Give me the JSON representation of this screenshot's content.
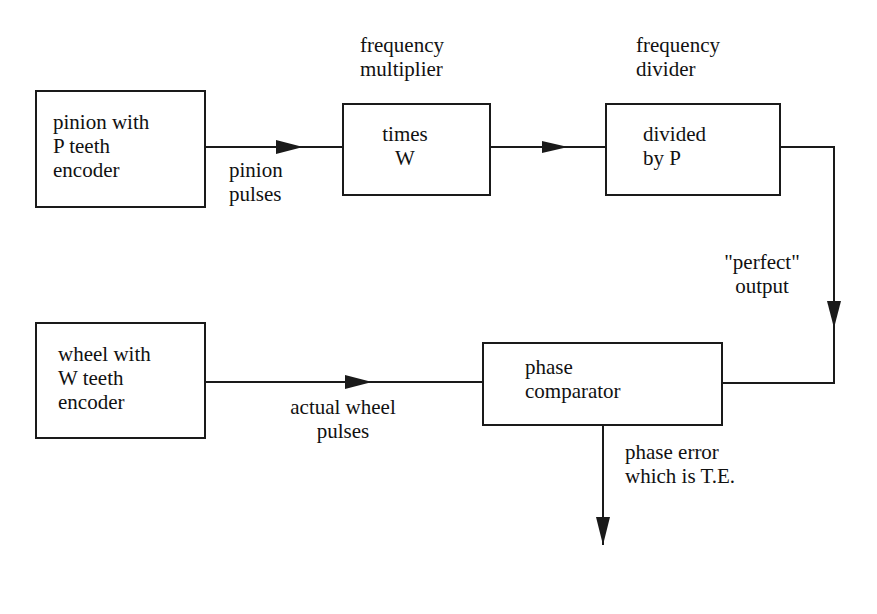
{
  "diagram": {
    "type": "block-diagram",
    "blocks": {
      "pinion_encoder": {
        "text": "pinion with\nP teeth\nencoder"
      },
      "multiplier": {
        "text": "times\nW",
        "title": "frequency\nmultiplier"
      },
      "divider": {
        "text": "divided\nby  P",
        "title": "frequency\ndivider"
      },
      "wheel_encoder": {
        "text": "wheel with\nW teeth\nencoder"
      },
      "phase_comparator": {
        "text": "phase\ncomparator"
      }
    },
    "edge_labels": {
      "pinion_pulses": "pinion\npulses",
      "perfect_output": "\"perfect\"\noutput",
      "actual_wheel_pulses": "actual wheel\npulses",
      "phase_error": "phase error\nwhich is T.E."
    },
    "edges": [
      {
        "from": "pinion_encoder",
        "to": "multiplier",
        "label": "pinion pulses"
      },
      {
        "from": "multiplier",
        "to": "divider",
        "label": ""
      },
      {
        "from": "divider",
        "to": "phase_comparator",
        "label": "\"perfect\" output"
      },
      {
        "from": "wheel_encoder",
        "to": "phase_comparator",
        "label": "actual wheel pulses"
      },
      {
        "from": "phase_comparator",
        "to": "output",
        "label": "phase error which is T.E."
      }
    ],
    "colors": {
      "line": "#1a1a1a",
      "background": "#ffffff"
    }
  }
}
